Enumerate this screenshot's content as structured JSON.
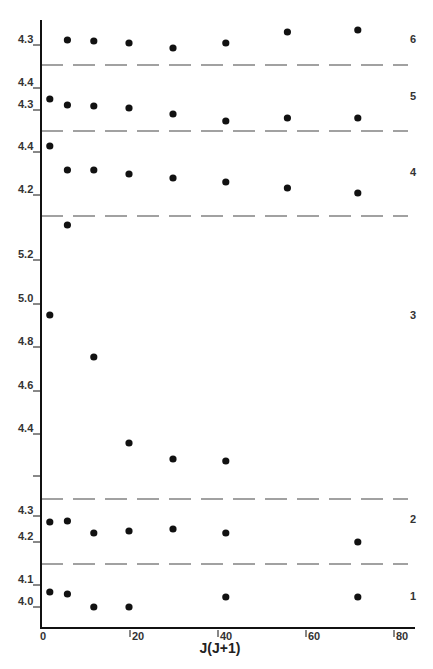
{
  "chart_data": {
    "type": "scatter",
    "title": "",
    "xlabel": "J(J+1)",
    "ylabel": "",
    "xlim": [
      0,
      82
    ],
    "x_ticks": [
      0,
      20,
      40,
      60,
      80
    ],
    "x_tick_labels": [
      "0",
      "20",
      "40",
      "60",
      "80"
    ],
    "grid": false,
    "legend": "none; panels labeled 1-6 on right",
    "panels": [
      {
        "label": "6",
        "y_ticks": [
          {
            "value": 4.3,
            "label": "4.3"
          }
        ],
        "points": [
          {
            "x": 6,
            "y": 4.31
          },
          {
            "x": 12,
            "y": 4.31
          },
          {
            "x": 20,
            "y": 4.305
          },
          {
            "x": 30,
            "y": 4.29
          },
          {
            "x": 42,
            "y": 4.305
          },
          {
            "x": 56,
            "y": 4.335
          },
          {
            "x": 72,
            "y": 4.34
          }
        ]
      },
      {
        "label": "5",
        "y_ticks": [
          {
            "value": 4.4,
            "label": "4.4"
          },
          {
            "value": 4.3,
            "label": "4.3"
          }
        ],
        "points": [
          {
            "x": 2,
            "y": 4.35
          },
          {
            "x": 6,
            "y": 4.32
          },
          {
            "x": 12,
            "y": 4.315
          },
          {
            "x": 20,
            "y": 4.305
          },
          {
            "x": 30,
            "y": 4.28
          },
          {
            "x": 42,
            "y": 4.25
          },
          {
            "x": 56,
            "y": 4.265
          },
          {
            "x": 72,
            "y": 4.265
          }
        ]
      },
      {
        "label": "4",
        "y_ticks": [
          {
            "value": 4.4,
            "label": "4.4"
          },
          {
            "value": 4.2,
            "label": "4.2"
          }
        ],
        "points": [
          {
            "x": 2,
            "y": 4.43
          },
          {
            "x": 6,
            "y": 4.32
          },
          {
            "x": 12,
            "y": 4.32
          },
          {
            "x": 20,
            "y": 4.305
          },
          {
            "x": 30,
            "y": 4.29
          },
          {
            "x": 42,
            "y": 4.27
          },
          {
            "x": 56,
            "y": 4.245
          },
          {
            "x": 72,
            "y": 4.225
          }
        ]
      },
      {
        "label": "3",
        "y_ticks": [
          {
            "value": 5.2,
            "label": "5.2"
          },
          {
            "value": 5.0,
            "label": "5.0"
          },
          {
            "value": 4.8,
            "label": "4.8"
          },
          {
            "value": 4.6,
            "label": "4.6"
          },
          {
            "value": 4.4,
            "label": "4.4"
          },
          {
            "value": 4.2,
            "label": ""
          }
        ],
        "points": [
          {
            "x": 2,
            "y": 4.92
          },
          {
            "x": 6,
            "y": 5.35
          },
          {
            "x": 12,
            "y": 4.73
          },
          {
            "x": 20,
            "y": 4.34
          },
          {
            "x": 30,
            "y": 4.27
          },
          {
            "x": 42,
            "y": 4.26
          }
        ]
      },
      {
        "label": "2",
        "y_ticks": [
          {
            "value": 4.3,
            "label": "4.3"
          },
          {
            "value": 4.2,
            "label": "4.2"
          }
        ],
        "points": [
          {
            "x": 2,
            "y": 4.28
          },
          {
            "x": 6,
            "y": 4.285
          },
          {
            "x": 12,
            "y": 4.235
          },
          {
            "x": 20,
            "y": 4.24
          },
          {
            "x": 30,
            "y": 4.25
          },
          {
            "x": 42,
            "y": 4.235
          },
          {
            "x": 72,
            "y": 4.2
          }
        ]
      },
      {
        "label": "1",
        "y_ticks": [
          {
            "value": 4.1,
            "label": "4.1"
          },
          {
            "value": 4.0,
            "label": "4.0"
          }
        ],
        "points": [
          {
            "x": 2,
            "y": 4.07
          },
          {
            "x": 6,
            "y": 4.06
          },
          {
            "x": 12,
            "y": 4.0
          },
          {
            "x": 20,
            "y": 4.0
          },
          {
            "x": 42,
            "y": 4.05
          },
          {
            "x": 72,
            "y": 4.05
          }
        ]
      }
    ]
  },
  "layout": {
    "x_px": {
      "origin": 42,
      "per_unit": 4.4
    },
    "x_axis_y": 628,
    "y_axis_top": 20,
    "separators_y": [
      65,
      131,
      216,
      499,
      564
    ],
    "separator_dash": "22,10",
    "panel_px": [
      {
        "ticks_y": [
          45
        ],
        "points_y": [
          40,
          41,
          43,
          48,
          43,
          32,
          30
        ],
        "label_y": 43
      },
      {
        "ticks_y": [
          88,
          110
        ],
        "points_y": [
          99,
          105,
          106,
          108,
          114,
          121,
          118,
          118
        ],
        "label_y": 100
      },
      {
        "ticks_y": [
          152,
          195
        ],
        "points_y": [
          146,
          170,
          170,
          174,
          178,
          182,
          188,
          193
        ],
        "label_y": 176
      },
      {
        "ticks_y": [
          260,
          304,
          347,
          391,
          434,
          476
        ],
        "points_y": [
          315,
          225,
          357,
          443,
          459,
          461
        ],
        "label_y": 319
      },
      {
        "ticks_y": [
          516,
          542
        ],
        "points_y": [
          522,
          521,
          533,
          531,
          529,
          533,
          542
        ],
        "label_y": 523
      },
      {
        "ticks_y": [
          585,
          607
        ],
        "points_y": [
          592,
          594,
          607,
          607,
          597,
          597
        ],
        "label_y": 600
      }
    ],
    "colors": {
      "axis": "#111111",
      "dash": "#444444",
      "point": "#111111",
      "text": "#333333"
    }
  }
}
